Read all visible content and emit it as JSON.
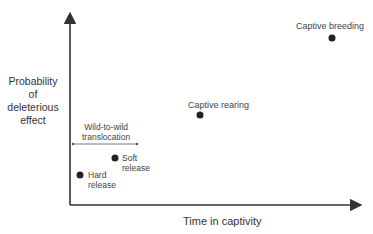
{
  "diagram": {
    "y_axis_label": [
      "Probability",
      "of",
      "deleterious",
      "effect"
    ],
    "x_axis_label": "Time in captivity",
    "bracket_label": [
      "Wild-to-wild",
      "translocation"
    ],
    "points": [
      {
        "name": "hard-release",
        "label": [
          "Hard",
          "release"
        ]
      },
      {
        "name": "soft-release",
        "label": [
          "Soft",
          "release"
        ]
      },
      {
        "name": "captive-rearing",
        "label": [
          "Captive rearing"
        ]
      },
      {
        "name": "captive-breeding",
        "label": [
          "Captive breeding"
        ]
      }
    ]
  }
}
